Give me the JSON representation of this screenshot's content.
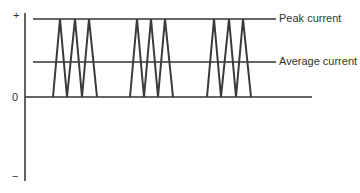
{
  "diagram": {
    "title": "",
    "axis": {
      "plus_label": "+",
      "zero_label": "0",
      "minus_label": "−"
    },
    "levels": {
      "peak_label": "Peak current",
      "average_label": "Average current"
    },
    "pulse_groups": [
      {
        "name": "group-1",
        "pulses": 3
      },
      {
        "name": "group-2",
        "pulses": 3
      },
      {
        "name": "group-3",
        "pulses": 3
      }
    ],
    "colors": {
      "line": "#333333",
      "pulse": "#3a3a3a",
      "background": "#ffffff"
    }
  }
}
